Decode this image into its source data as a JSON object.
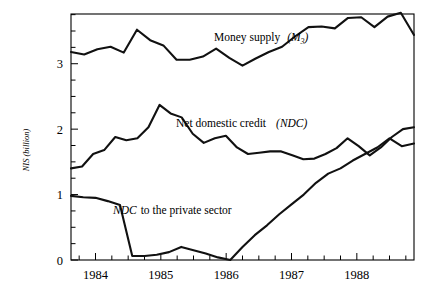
{
  "chart_data": {
    "type": "line",
    "title": "",
    "xlabel": "",
    "ylabel": "NIS (billion)",
    "ylim": [
      0,
      3.76
    ],
    "xlim": [
      1983.625,
      1988.875
    ],
    "grid": false,
    "legend_position": "inline-annotations",
    "y_ticks_major": [
      0,
      1,
      2,
      3
    ],
    "y_tick_labels": [
      "0",
      "1",
      "2",
      "3"
    ],
    "y_minor_step": 0.25,
    "x_ticks_major": [
      1984,
      1985,
      1986,
      1987,
      1988
    ],
    "x_tick_labels": [
      "1984",
      "1985",
      "1986",
      "1987",
      "1988"
    ],
    "x_minor_step": 0.25,
    "x": [
      1983.625,
      1983.875,
      1984.125,
      1984.375,
      1984.625,
      1984.875,
      1985.125,
      1985.375,
      1985.625,
      1985.875,
      1986.125,
      1986.375,
      1986.625,
      1986.875,
      1987.125,
      1987.375,
      1987.625,
      1987.875,
      1988.125,
      1988.375,
      1988.625,
      1988.875
    ],
    "series": [
      {
        "name": "Money supply (M3)",
        "label_plain": "Money supply",
        "label_paren": "(M3)",
        "values": [
          3.18,
          3.14,
          3.22,
          3.26,
          3.17,
          3.52,
          3.36,
          3.28,
          3.06,
          3.06,
          3.11,
          3.23,
          3.09,
          2.97,
          3.08,
          3.18,
          3.26,
          3.42,
          3.56,
          3.57,
          3.54,
          3.7
        ]
      },
      {
        "name": "Net domestic credit (NDC)",
        "label_plain": "Net domestic credit",
        "label_paren": "(NDC)",
        "values": [
          1.4,
          1.43,
          1.62,
          1.68,
          1.88,
          1.83,
          1.86,
          2.03,
          2.37,
          2.24,
          2.18,
          1.93,
          1.79,
          1.86,
          1.9,
          1.72,
          1.62,
          1.64,
          1.66,
          1.66,
          1.6,
          1.54
        ]
      },
      {
        "name": "NDC to the private sector",
        "label_plain": "NDC to the private sector",
        "label_paren": "",
        "values": [
          0.98,
          0.96,
          0.95,
          0.9,
          0.84,
          0.06,
          0.06,
          0.08,
          0.12,
          0.2,
          0.15,
          0.1,
          0.04,
          0.0,
          0.2,
          0.38,
          0.53,
          0.7,
          0.85,
          1.0,
          1.18,
          1.32
        ]
      }
    ],
    "series_extended": {
      "money_supply_tail": [
        3.71,
        3.56,
        3.72,
        3.78,
        3.44
      ],
      "ndc_tail": [
        1.55,
        1.62,
        1.71,
        1.86,
        1.74,
        1.6,
        1.72,
        1.88,
        2.0,
        2.03
      ],
      "private_tail": [
        1.4,
        1.52,
        1.62,
        1.72,
        1.86,
        1.74,
        1.78
      ]
    },
    "annotations": [
      {
        "id": "money-supply-label",
        "text_plain": "Money supply",
        "text_paren": "(M",
        "text_sub": "3",
        "text_close": ")",
        "x_px": 214,
        "y_px": 41
      },
      {
        "id": "ndc-label",
        "text_plain": "Net domestic credit",
        "text_paren": "(NDC)",
        "x_px": 176,
        "y_px": 127
      },
      {
        "id": "private-sector-label",
        "text_ital": "NDC",
        "text_plain": "to the private sector",
        "x_px": 113,
        "y_px": 214
      }
    ],
    "colors": {
      "line": "#111111",
      "axis": "#000000",
      "background": "#ffffff"
    }
  },
  "axis": {
    "y_label": "NIS (billion)",
    "y_label_nis": "NIS",
    "y_label_unit": "(billion)"
  }
}
